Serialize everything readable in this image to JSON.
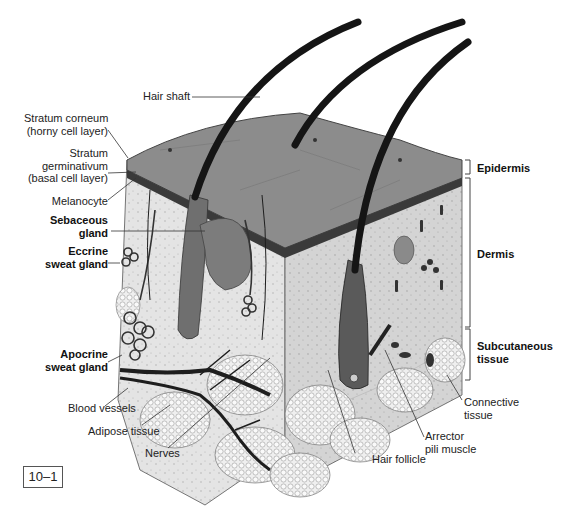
{
  "figure": {
    "number": "10–1",
    "colors": {
      "surface": "#8a8a8a",
      "dermis": "#cfcfcf",
      "hair": "#1a1a1a",
      "adipose": "#e6e6e6",
      "vessel": "#2a2a2a"
    }
  },
  "labels": {
    "hair_shaft": "Hair shaft",
    "stratum_corneum": [
      "Stratum corneum",
      "(horny cell layer)"
    ],
    "stratum_germinativum": [
      "Stratum",
      "germinativum",
      "(basal cell layer)"
    ],
    "melanocyte": "Melanocyte",
    "sebaceous_gland": [
      "Sebaceous",
      "gland"
    ],
    "eccrine_sweat_gland": [
      "Eccrine",
      "sweat gland"
    ],
    "apocrine_sweat_gland": [
      "Apocrine",
      "sweat gland"
    ],
    "blood_vessels": "Blood vessels",
    "adipose_tissue": "Adipose tissue",
    "nerves": "Nerves",
    "hair_follicle": "Hair follicle",
    "arrector_pili_muscle": [
      "Arrector",
      "pili muscle"
    ],
    "connective_tissue": [
      "Connective",
      "tissue"
    ]
  },
  "layers": {
    "epidermis": "Epidermis",
    "dermis": "Dermis",
    "subcutaneous": [
      "Subcutaneous",
      "tissue"
    ]
  }
}
